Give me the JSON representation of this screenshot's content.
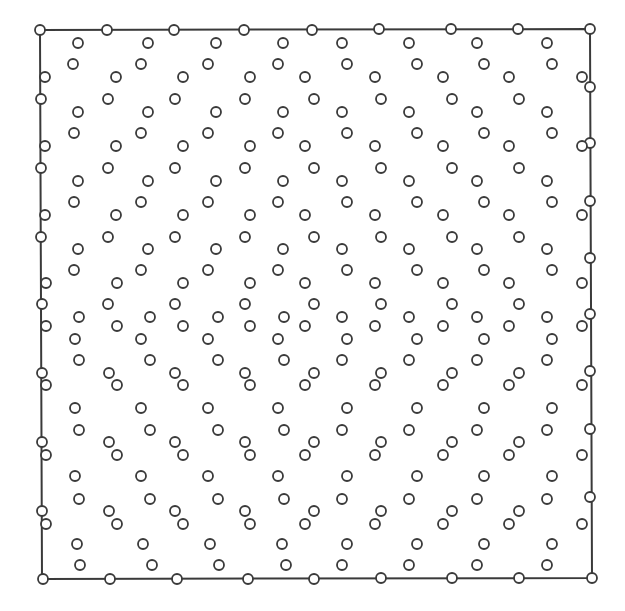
{
  "diagram": {
    "type": "point-distribution-in-square",
    "frame": {
      "corners": [
        [
          40,
          30
        ],
        [
          590,
          29
        ],
        [
          592,
          578
        ],
        [
          42,
          579
        ]
      ],
      "stroke_color": "#3a3a3a"
    },
    "marker": {
      "shape": "open-circle",
      "radius": 5,
      "stroke_color": "#3a3a3a",
      "fill_color": "#ffffff"
    },
    "border_points": {
      "top": [
        [
          40,
          30
        ],
        [
          107,
          30
        ],
        [
          174,
          30
        ],
        [
          244,
          30
        ],
        [
          312,
          30
        ],
        [
          379,
          29
        ],
        [
          451,
          29
        ],
        [
          518,
          29
        ],
        [
          590,
          29
        ]
      ],
      "bottom": [
        [
          43,
          579
        ],
        [
          110,
          579
        ],
        [
          177,
          579
        ],
        [
          248,
          579
        ],
        [
          314,
          579
        ],
        [
          381,
          578
        ],
        [
          452,
          578
        ],
        [
          519,
          578
        ],
        [
          592,
          578
        ]
      ],
      "left": [
        [
          41,
          99
        ],
        [
          41,
          168
        ],
        [
          41,
          237
        ],
        [
          42,
          304
        ],
        [
          42,
          373
        ],
        [
          42,
          442
        ],
        [
          42,
          511
        ]
      ],
      "right": [
        [
          590,
          87
        ],
        [
          590,
          143
        ],
        [
          590,
          201
        ],
        [
          590,
          258
        ],
        [
          590,
          314
        ],
        [
          590,
          371
        ],
        [
          590,
          429
        ],
        [
          590,
          497
        ]
      ]
    },
    "interior_rows": [
      {
        "y": 43,
        "x": [
          78,
          148,
          216,
          283,
          342,
          409,
          477,
          547
        ]
      },
      {
        "y": 64,
        "x": [
          73,
          141,
          208,
          278,
          347,
          417,
          484,
          552
        ]
      },
      {
        "y": 77,
        "x": [
          45,
          116,
          183,
          250,
          305,
          375,
          443,
          509,
          582
        ]
      },
      {
        "y": 99,
        "x": [
          108,
          175,
          245,
          314,
          381,
          452,
          519
        ]
      },
      {
        "y": 112,
        "x": [
          78,
          148,
          216,
          283,
          342,
          409,
          477,
          547
        ]
      },
      {
        "y": 133,
        "x": [
          74,
          141,
          208,
          278,
          347,
          417,
          484,
          552
        ]
      },
      {
        "y": 146,
        "x": [
          45,
          116,
          183,
          250,
          305,
          375,
          443,
          509,
          582
        ]
      },
      {
        "y": 168,
        "x": [
          108,
          175,
          245,
          314,
          381,
          452,
          519
        ]
      },
      {
        "y": 181,
        "x": [
          78,
          148,
          216,
          283,
          342,
          409,
          477,
          547
        ]
      },
      {
        "y": 202,
        "x": [
          74,
          141,
          208,
          278,
          347,
          417,
          484,
          552
        ]
      },
      {
        "y": 215,
        "x": [
          45,
          116,
          183,
          250,
          305,
          375,
          443,
          509,
          582
        ]
      },
      {
        "y": 237,
        "x": [
          108,
          175,
          245,
          314,
          381,
          452,
          519
        ]
      },
      {
        "y": 249,
        "x": [
          78,
          148,
          216,
          283,
          342,
          409,
          477,
          547
        ]
      },
      {
        "y": 270,
        "x": [
          74,
          141,
          208,
          278,
          347,
          417,
          484,
          552
        ]
      },
      {
        "y": 283,
        "x": [
          46,
          117,
          183,
          250,
          305,
          375,
          443,
          509,
          582
        ]
      },
      {
        "y": 304,
        "x": [
          108,
          175,
          245,
          314,
          381,
          452,
          519
        ]
      },
      {
        "y": 317,
        "x": [
          79,
          150,
          218,
          284,
          342,
          409,
          477,
          547
        ]
      },
      {
        "y": 326,
        "x": [
          46,
          117,
          183,
          250,
          305,
          375,
          443,
          509,
          582
        ]
      },
      {
        "y": 339,
        "x": [
          75,
          141,
          208,
          278,
          347,
          417,
          484,
          552
        ]
      },
      {
        "y": 360,
        "x": [
          79,
          150,
          218,
          284,
          342,
          409,
          477,
          547
        ]
      },
      {
        "y": 373,
        "x": [
          109,
          175,
          245,
          314,
          381,
          452,
          519
        ]
      },
      {
        "y": 385,
        "x": [
          46,
          117,
          183,
          250,
          305,
          375,
          443,
          509,
          582
        ]
      },
      {
        "y": 408,
        "x": [
          75,
          141,
          208,
          278,
          347,
          417,
          484,
          552
        ]
      },
      {
        "y": 430,
        "x": [
          79,
          150,
          218,
          284,
          342,
          409,
          477,
          547
        ]
      },
      {
        "y": 442,
        "x": [
          109,
          175,
          245,
          314,
          381,
          452,
          519
        ]
      },
      {
        "y": 455,
        "x": [
          46,
          117,
          183,
          250,
          305,
          375,
          443,
          509,
          582
        ]
      },
      {
        "y": 476,
        "x": [
          75,
          141,
          208,
          278,
          347,
          417,
          484,
          552
        ]
      },
      {
        "y": 499,
        "x": [
          79,
          150,
          218,
          284,
          342,
          409,
          477,
          547
        ]
      },
      {
        "y": 511,
        "x": [
          109,
          175,
          245,
          314,
          381,
          452,
          519
        ]
      },
      {
        "y": 524,
        "x": [
          46,
          117,
          183,
          250,
          305,
          375,
          443,
          509,
          582
        ]
      },
      {
        "y": 544,
        "x": [
          77,
          143,
          210,
          282,
          347,
          417,
          484,
          552
        ]
      },
      {
        "y": 565,
        "x": [
          80,
          152,
          219,
          286,
          342,
          409,
          477,
          547
        ]
      }
    ]
  }
}
